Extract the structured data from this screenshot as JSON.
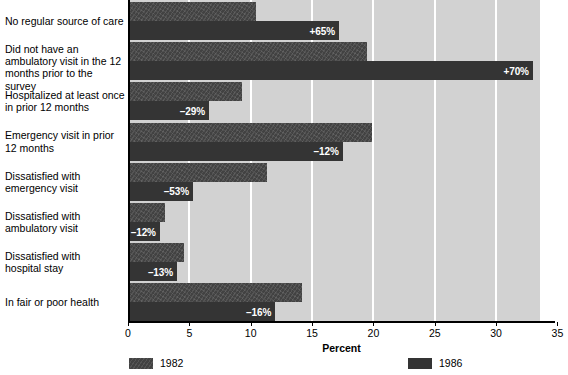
{
  "chart_data": {
    "type": "bar",
    "orientation": "horizontal",
    "title": "",
    "xlabel": "Percent",
    "ylabel": "",
    "xlim": [
      0,
      35
    ],
    "xticks": [
      0,
      5,
      10,
      15,
      20,
      25,
      30,
      35
    ],
    "grid": true,
    "legend_position": "bottom",
    "categories": [
      "No regular source of care",
      "Did not have an ambulatory visit in the  12 months prior to the survey",
      "Hospitalized at least once in prior 12 months",
      "Emergency visit in prior 12 months",
      "Dissatisfied with emergency visit",
      "Dissatisfied with ambulatory visit",
      "Dissatisfied with hospital stay",
      "In fair or poor health"
    ],
    "series": [
      {
        "name": "1982",
        "values": [
          10.4,
          19.5,
          9.3,
          19.9,
          11.3,
          3.0,
          4.6,
          14.2
        ]
      },
      {
        "name": "1986",
        "values": [
          17.2,
          33.0,
          6.6,
          17.5,
          5.3,
          2.6,
          4.0,
          12.0
        ]
      }
    ],
    "annotations": [
      "+65%",
      "+70%",
      "–29%",
      "–12%",
      "–53%",
      "–12%",
      "–13%",
      "–16%"
    ]
  },
  "category_labels": [
    {
      "lines": [
        "No regular source of care"
      ]
    },
    {
      "lines": [
        "Did not have an",
        "ambulatory visit in the  12",
        "months prior to the survey"
      ]
    },
    {
      "lines": [
        "Hospitalized at least once",
        "in prior 12 months"
      ]
    },
    {
      "lines": [
        "Emergency visit in prior",
        "12 months"
      ]
    },
    {
      "lines": [
        "Dissatisfied with",
        "emergency visit"
      ]
    },
    {
      "lines": [
        "Dissatisfied with",
        "ambulatory visit"
      ]
    },
    {
      "lines": [
        "Dissatisfied with",
        "hospital stay"
      ]
    },
    {
      "lines": [
        "In fair or poor health"
      ]
    }
  ],
  "axis": {
    "x_title": "Percent",
    "tick_labels": [
      "0",
      "5",
      "10",
      "15",
      "20",
      "25",
      "30",
      "35"
    ]
  },
  "legend": {
    "entries": [
      {
        "label": "1982",
        "swatch": "series-1982-swatch"
      },
      {
        "label": "1986",
        "swatch": "series-1986-swatch"
      }
    ]
  },
  "colors": {
    "plot_background": "#d2d2d2",
    "gridline": "#ffffff",
    "series_1982": "#424242",
    "series_1986": "#343434",
    "axis": "#000000",
    "value_label": "#ffffff"
  }
}
